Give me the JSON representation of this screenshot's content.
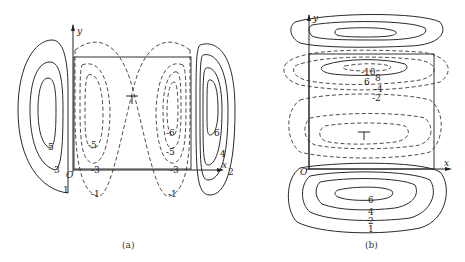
{
  "panel_a": {
    "caption": "(a)",
    "axis_x": "x",
    "axis_y": "y",
    "origin": "O",
    "labels_positive": [
      "5",
      "3",
      "1",
      "6",
      "4",
      "2"
    ],
    "labels_negative": [
      "-5",
      "-3",
      "-1",
      "-6",
      "-5",
      "-3",
      "-1"
    ]
  },
  "panel_b": {
    "caption": "(b)",
    "axis_x": "x",
    "axis_y": "y",
    "origin": "O",
    "labels_top": [
      "-10",
      "8",
      "6",
      "-4",
      "-2"
    ],
    "labels_bottom": [
      "6",
      "4",
      "2",
      "1"
    ]
  }
}
